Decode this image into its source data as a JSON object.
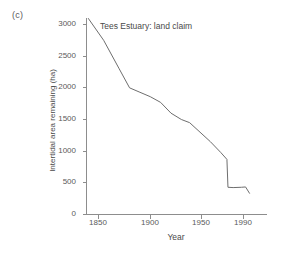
{
  "figure": {
    "panel_label": "(c)",
    "background_color": "#ffffff",
    "line_color": "#6e6e6e",
    "axis_color": "#8d8d8d",
    "text_color": "#4a4a4a"
  },
  "chart_data": {
    "type": "line",
    "title": "Tees Estuary: land claim",
    "xlabel": "Year",
    "ylabel": "Intertidal area remaining (ha)",
    "xlim": [
      1838,
      1998
    ],
    "ylim": [
      0,
      3150
    ],
    "grid": false,
    "legend": null,
    "xticks": [
      1850,
      1900,
      1950,
      1990
    ],
    "xtick_labels": [
      "1850",
      "1900",
      "1950",
      "1990"
    ],
    "yticks": [
      0,
      500,
      1000,
      1500,
      2000,
      2500,
      3000
    ],
    "ytick_labels": [
      "0",
      "500",
      "1000",
      "1500",
      "2000",
      "2500",
      "3000"
    ],
    "series": [
      {
        "name": "Intertidal area remaining",
        "x": [
          1840,
          1855,
          1870,
          1880,
          1890,
          1900,
          1910,
          1920,
          1930,
          1938,
          1948,
          1958,
          1968,
          1974,
          1975,
          1980,
          1988,
          1992,
          1996
        ],
        "values": [
          3100,
          2750,
          2300,
          2000,
          1930,
          1860,
          1770,
          1600,
          1500,
          1450,
          1300,
          1150,
          980,
          870,
          430,
          425,
          430,
          435,
          330
        ]
      }
    ]
  }
}
